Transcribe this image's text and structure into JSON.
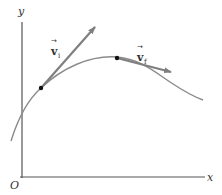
{
  "figure": {
    "axes": {
      "y_label": "y",
      "x_label": "x",
      "origin_label": "O"
    },
    "trajectory": {
      "description": "curved path of a particle"
    },
    "vectors": [
      {
        "symbol": "v",
        "subscript": "i",
        "arrow": "→",
        "meaning": "initial velocity"
      },
      {
        "symbol": "v",
        "subscript": "f",
        "arrow": "→",
        "meaning": "final velocity"
      }
    ],
    "colors": {
      "axis": "#555555",
      "curve": "#8a8a8a",
      "vector": "#7f7f7f",
      "point": "#111111",
      "text": "#333333"
    }
  }
}
